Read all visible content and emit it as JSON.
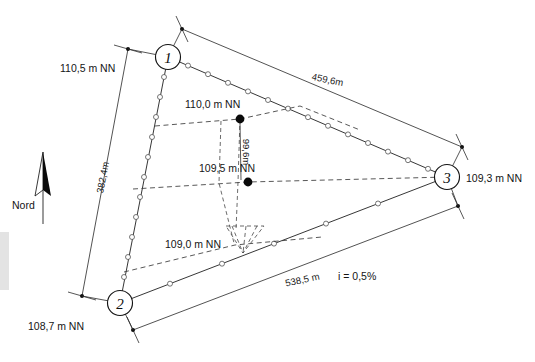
{
  "figure": {
    "kind": "site-survey-plan",
    "north_label": "Nord",
    "gradient_note": "i = 0,5%"
  },
  "nodes": [
    {
      "id": "1",
      "label": "1",
      "x": 168,
      "y": 57,
      "r": 12.5
    },
    {
      "id": "2",
      "label": "2",
      "x": 120,
      "y": 303,
      "r": 12.5
    },
    {
      "id": "3",
      "label": "3",
      "x": 447,
      "y": 177,
      "r": 12.5
    }
  ],
  "elevations": [
    {
      "name": "corner-1-elevation",
      "text": "110,5 m NN",
      "x": 60,
      "y": 72,
      "anchor": "start"
    },
    {
      "name": "corner-2-elevation",
      "text": "108,7 m NN",
      "x": 28,
      "y": 330,
      "anchor": "start"
    },
    {
      "name": "corner-3-elevation",
      "text": "109,3 m NN",
      "x": 466,
      "y": 182,
      "anchor": "start"
    },
    {
      "name": "contour-110-0",
      "text": "110,0 m NN",
      "x": 185,
      "y": 108,
      "anchor": "start"
    },
    {
      "name": "contour-109-5",
      "text": "109,5 m NN",
      "x": 199,
      "y": 172,
      "anchor": "start"
    },
    {
      "name": "contour-109-0",
      "text": "109,0 m NN",
      "x": 165,
      "y": 248,
      "anchor": "start"
    }
  ],
  "dimensions": [
    {
      "name": "side-1-3-length",
      "text": "459,6m",
      "x": 327,
      "y": 83,
      "rotate": 11.5
    },
    {
      "name": "side-1-2-length",
      "text": "382,4m",
      "x": 106,
      "y": 178,
      "rotate": -79
    },
    {
      "name": "side-2-3-length",
      "text": "538,5 m",
      "x": 303,
      "y": 283,
      "rotate": -12
    },
    {
      "name": "spot-offset",
      "text": "99,6m",
      "x": 243,
      "y": 152,
      "rotate": 90
    }
  ],
  "spot_heights": [
    {
      "name": "spot-height-110-0",
      "x": 240,
      "y": 119,
      "r": 4.4
    },
    {
      "name": "spot-height-109-5",
      "x": 248,
      "y": 182,
      "r": 4.4
    }
  ],
  "colors": {
    "ink": "#1a1a1a",
    "paper": "#ffffff",
    "dashed": "#3a3a3a",
    "scan_artifact": "#e3e3e3"
  }
}
